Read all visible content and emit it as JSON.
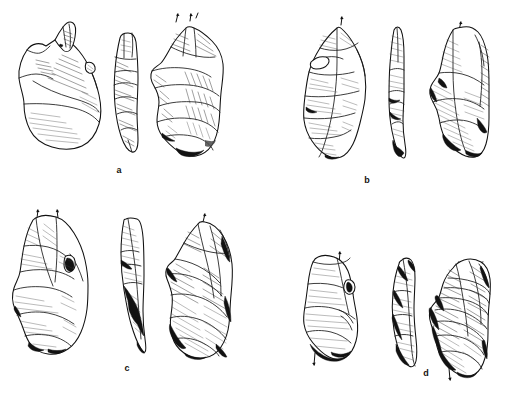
{
  "plate": {
    "title": "Lithic artefact illustration plate",
    "background_color": "#ffffff",
    "ink_color": "#111111",
    "width": 507,
    "height": 393,
    "technique": "pen-and-ink stipple and hatch line drawing",
    "scale_bar": ""
  },
  "groups": [
    {
      "id": "a",
      "caption": "a",
      "caption_x": 118,
      "caption_y": 168,
      "views": [
        {
          "name": "dorsal-face-view",
          "position": "left",
          "description": "broad triangular flake with convergent distal tip and sweeping hatched ridge scars"
        },
        {
          "name": "profile-view",
          "position": "centre",
          "description": "narrow elongated side profile showing stepped transverse ridges"
        },
        {
          "name": "ventral-face-view",
          "position": "right",
          "description": "opposite face with large overlapping flake scars and dark shaded distal edge"
        }
      ],
      "direction_marks": 2
    },
    {
      "id": "b",
      "caption": "b",
      "caption_x": 365,
      "caption_y": 178,
      "views": [
        {
          "name": "dorsal-face-view",
          "position": "left",
          "description": "elongated pointed blade-like flake with fine longitudinal hatching"
        },
        {
          "name": "profile-view",
          "position": "centre",
          "description": "very slender curved profile with dark shaded basal end"
        },
        {
          "name": "ventral-face-view",
          "position": "right",
          "description": "opposite face with retouched lateral margin and dense diagonal hatching"
        }
      ],
      "direction_marks": 2
    },
    {
      "id": "c",
      "caption": "c",
      "caption_x": 126,
      "caption_y": 366,
      "views": [
        {
          "name": "dorsal-face-view",
          "position": "left",
          "description": "broad sub-triangular flake with prominent pointed apex and cortical shoulder"
        },
        {
          "name": "profile-view",
          "position": "centre",
          "description": "thin tapering profile with dark shaded ventral edge"
        },
        {
          "name": "ventral-face-view",
          "position": "right",
          "description": "opposite face with multiple stepped scars and heavy hatching"
        }
      ],
      "direction_marks": 3
    },
    {
      "id": "d",
      "caption": "d",
      "caption_x": 426,
      "caption_y": 371,
      "views": [
        {
          "name": "dorsal-face-view",
          "position": "left",
          "description": "small irregular flake with faint horizontal hatch lines and dark basal shading"
        },
        {
          "name": "profile-view",
          "position": "centre",
          "description": "narrow profile with dark shaded lateral margin"
        },
        {
          "name": "ventral-face-view",
          "position": "right",
          "description": "opposite face with tightly stacked transverse scars and dense shading"
        }
      ],
      "direction_marks": 3
    }
  ]
}
